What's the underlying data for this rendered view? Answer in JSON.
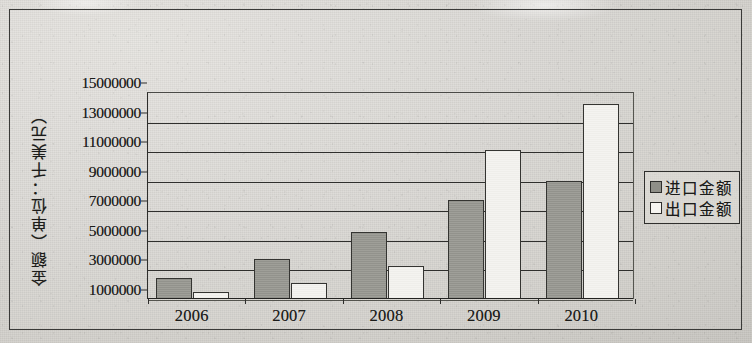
{
  "chart_data": {
    "type": "bar",
    "title": "",
    "xlabel": "",
    "ylabel": "金额（单位：千美元）",
    "categories": [
      "2006",
      "2007",
      "2008",
      "2009",
      "2010"
    ],
    "series": [
      {
        "name": "进口金额",
        "color": "#9a9a93",
        "values": [
          2400000,
          3700000,
          5500000,
          7700000,
          9000000
        ]
      },
      {
        "name": "出口金额",
        "color": "#f4f3ef",
        "values": [
          1500000,
          2100000,
          3200000,
          11100000,
          14200000
        ]
      }
    ],
    "ylim": [
      1000000,
      15000000
    ],
    "yticks": [
      "15000000",
      "13000000",
      "11000000",
      "9000000",
      "7000000",
      "5000000",
      "3000000",
      "1000000"
    ],
    "ytick_values": [
      15000000,
      13000000,
      11000000,
      9000000,
      7000000,
      5000000,
      3000000,
      1000000
    ],
    "ytick_step": 2000000,
    "grid": true,
    "grid_axis": "y",
    "legend_position": "right"
  },
  "legend": {
    "items": [
      {
        "label": "进口金额",
        "swatch": "filled-gray-swatch"
      },
      {
        "label": "出口金额",
        "swatch": "empty-white-swatch"
      }
    ]
  },
  "axis": {
    "y_title": "金额（单位：千美元）"
  },
  "colors": {
    "import_fill": "#9a9a93",
    "export_fill": "#f4f3ef",
    "border": "#343431",
    "background": "#d8d6d2",
    "text": "#1b1b19"
  }
}
